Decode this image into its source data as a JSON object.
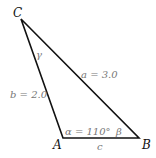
{
  "diagram": {
    "type": "triangle",
    "vertices": {
      "A": "A",
      "B": "B",
      "C": "C"
    },
    "sides": {
      "a": "a = 3.0",
      "b": "b = 2.0",
      "c": "c"
    },
    "angles": {
      "alpha": "α = 110°",
      "beta": "β",
      "gamma": "γ"
    },
    "colors": {
      "line": "#111111",
      "label": "#777777"
    }
  }
}
